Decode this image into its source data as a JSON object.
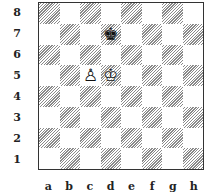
{
  "diagram": {
    "type": "chess-position",
    "ranks": [
      "8",
      "7",
      "6",
      "5",
      "4",
      "3",
      "2",
      "1"
    ],
    "files": [
      "a",
      "b",
      "c",
      "d",
      "e",
      "f",
      "g",
      "h"
    ],
    "pieces": [
      {
        "square": "d7",
        "piece": "king",
        "color": "black",
        "glyph": "♚"
      },
      {
        "square": "c5",
        "piece": "pawn",
        "color": "white",
        "glyph": "♙"
      },
      {
        "square": "d5",
        "piece": "king",
        "color": "white",
        "glyph": "♔"
      }
    ]
  }
}
